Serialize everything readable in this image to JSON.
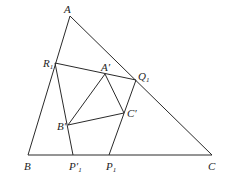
{
  "diagram": {
    "type": "geometry-figure",
    "colors": {
      "line": "#2a2a2a",
      "text": "#1e1e1e",
      "background": "#ffffff"
    },
    "points": {
      "A": {
        "label": "A",
        "sub": "",
        "x": 70,
        "y": 16
      },
      "B": {
        "label": "B",
        "sub": "",
        "x": 28,
        "y": 155
      },
      "C": {
        "label": "C",
        "sub": "",
        "x": 212,
        "y": 155
      },
      "R1": {
        "label": "R",
        "sub": "1",
        "x": 55,
        "y": 63
      },
      "Q1": {
        "label": "Q",
        "sub": "1",
        "x": 136,
        "y": 80
      },
      "A_prime": {
        "label": "A′",
        "sub": "",
        "x": 105,
        "y": 74
      },
      "B_prime": {
        "label": "B′",
        "sub": "",
        "x": 68,
        "y": 125
      },
      "C_prime": {
        "label": "C′",
        "sub": "",
        "x": 124,
        "y": 113
      },
      "P1_prime": {
        "label": "P′",
        "sub": "1",
        "x": 73,
        "y": 155
      },
      "P1": {
        "label": "P",
        "sub": "1",
        "x": 109,
        "y": 155
      }
    },
    "edges": [
      [
        "A",
        "B"
      ],
      [
        "B",
        "C"
      ],
      [
        "C",
        "A"
      ],
      [
        "R1",
        "Q1"
      ],
      [
        "R1",
        "P1_prime"
      ],
      [
        "Q1",
        "P1"
      ],
      [
        "A_prime",
        "B_prime"
      ],
      [
        "B_prime",
        "C_prime"
      ],
      [
        "C_prime",
        "A_prime"
      ]
    ]
  }
}
